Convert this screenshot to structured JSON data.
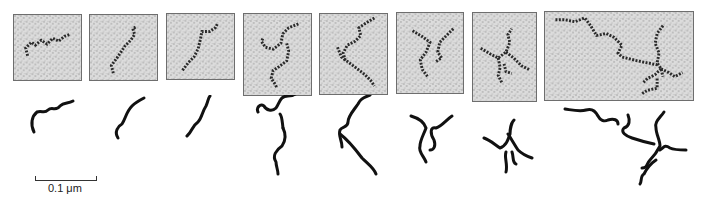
{
  "figure": {
    "panels": [
      {
        "id": 1,
        "x": 13,
        "y": 14,
        "w": 69,
        "h": 67,
        "branches": 1
      },
      {
        "id": 2,
        "x": 89,
        "y": 14,
        "w": 69,
        "h": 67,
        "branches": 1
      },
      {
        "id": 3,
        "x": 166,
        "y": 13,
        "w": 69,
        "h": 67,
        "branches": 1
      },
      {
        "id": 4,
        "x": 243,
        "y": 13,
        "w": 69,
        "h": 83,
        "branches": 2
      },
      {
        "id": 5,
        "x": 319,
        "y": 13,
        "w": 69,
        "h": 82,
        "branches": 2
      },
      {
        "id": 6,
        "x": 396,
        "y": 12,
        "w": 68,
        "h": 82,
        "branches": 3
      },
      {
        "id": 7,
        "x": 472,
        "y": 12,
        "w": 65,
        "h": 90,
        "branches": 4
      },
      {
        "id": 8,
        "x": 544,
        "y": 11,
        "w": 150,
        "h": 90,
        "branches": 5
      }
    ],
    "scale_bar": {
      "label": "0.1 μm"
    },
    "colors": {
      "panel_bg": "#d9d9d9",
      "panel_border": "#6e6e6e",
      "chain": "#1a1a1a",
      "tracing": "#111111"
    }
  }
}
